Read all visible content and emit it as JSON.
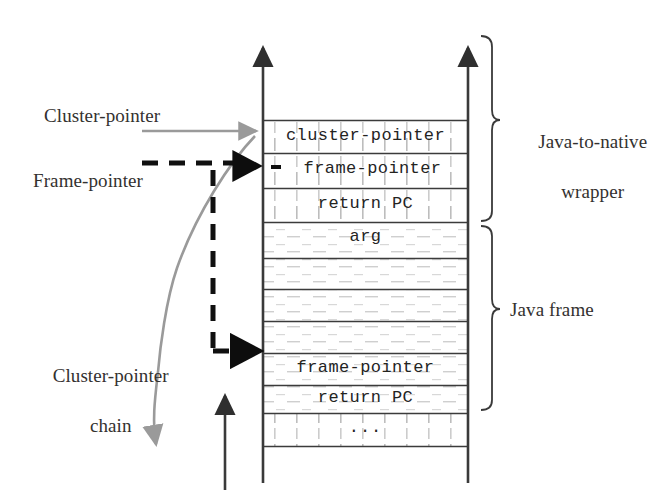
{
  "figure": {
    "kind": "stack-layout-diagram",
    "background_color": "#ffffff",
    "ink_color": "#2b2b2b",
    "accent_gray": "#8d8d8d"
  },
  "stack": {
    "left_rail_label": "stack-left-boundary",
    "right_rail_label": "stack-right-boundary",
    "cells": [
      {
        "id": "cell-cluster-pointer",
        "text": "cluster-pointer",
        "group": "java-to-native-wrapper"
      },
      {
        "id": "cell-frame-pointer-top",
        "text": "frame-pointer",
        "group": "java-to-native-wrapper"
      },
      {
        "id": "cell-return-pc-top",
        "text": "return PC",
        "group": "java-to-native-wrapper"
      },
      {
        "id": "cell-arg",
        "text": "arg",
        "group": "java-frame"
      },
      {
        "id": "cell-blank-1",
        "text": "",
        "group": "java-frame"
      },
      {
        "id": "cell-blank-2",
        "text": "",
        "group": "java-frame"
      },
      {
        "id": "cell-blank-3",
        "text": "",
        "group": "java-frame"
      },
      {
        "id": "cell-frame-pointer-bottom",
        "text": "frame-pointer",
        "group": "java-frame"
      },
      {
        "id": "cell-return-pc-bottom",
        "text": "return PC",
        "group": "java-frame"
      },
      {
        "id": "cell-ellipsis",
        "text": "...",
        "group": "below"
      }
    ]
  },
  "labels": {
    "cluster_pointer": "Cluster-pointer",
    "frame_pointer": "Frame-pointer",
    "cluster_pointer_chain_line1": "Cluster-pointer",
    "cluster_pointer_chain_line2": "chain",
    "java_to_native_wrapper_line1": "Java-to-native",
    "java_to_native_wrapper_line2": "wrapper",
    "java_frame": "Java frame"
  },
  "brackets": [
    {
      "id": "bracket-java-to-native-wrapper",
      "label": "Java-to-native wrapper"
    },
    {
      "id": "bracket-java-frame",
      "label": "Java frame"
    }
  ],
  "arrows": [
    {
      "id": "arrow-cluster-pointer",
      "style": "solid",
      "color": "#8d8d8d",
      "points_to": "cell-cluster-pointer"
    },
    {
      "id": "arrow-frame-pointer-top",
      "style": "dashed",
      "color": "#111111",
      "points_to": "cell-frame-pointer-top"
    },
    {
      "id": "arrow-frame-pointer-bottom",
      "style": "dashed",
      "color": "#111111",
      "points_to": "cell-frame-pointer-bottom"
    },
    {
      "id": "arrow-cluster-pointer-chain",
      "style": "curved",
      "color": "#8d8d8d",
      "points_to": "below-stack"
    },
    {
      "id": "arrow-stack-growth",
      "style": "solid",
      "color": "#3a3a3a",
      "points_to": "upward"
    },
    {
      "id": "arrow-left-rail-top",
      "style": "solid",
      "color": "#3a3a3a",
      "points_to": "upward"
    },
    {
      "id": "arrow-right-rail-top",
      "style": "solid",
      "color": "#3a3a3a",
      "points_to": "upward"
    }
  ]
}
